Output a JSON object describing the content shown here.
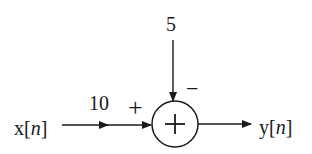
{
  "diagram": {
    "type": "block-diagram",
    "input": {
      "label": "x",
      "index": "n"
    },
    "output": {
      "label": "y",
      "index": "n"
    },
    "gain": {
      "label": "10"
    },
    "subtracted_input": {
      "label": "5"
    },
    "summer": {
      "symbol": "+",
      "signs": {
        "left": "+",
        "top": "−"
      }
    },
    "colors": {
      "stroke": "#1a1a1a",
      "background": "#ffffff"
    }
  }
}
